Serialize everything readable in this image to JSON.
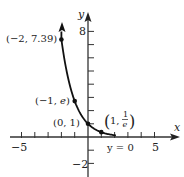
{
  "chart_data": {
    "type": "line",
    "title": "",
    "function": "y = e^(-x)",
    "xlabel": "x",
    "ylabel": "y",
    "xlim": [
      -5.8,
      6.8
    ],
    "ylim": [
      -2.4,
      8.8
    ],
    "grid": false,
    "x_ticks": [
      -5,
      -4,
      -3,
      -2,
      -1,
      1,
      2,
      3,
      4,
      5
    ],
    "y_ticks": [
      -2,
      -1,
      1,
      2,
      3,
      4,
      5,
      6,
      7,
      8
    ],
    "x_tick_labels": [
      {
        "value": -5,
        "text": "−5"
      },
      {
        "value": 5,
        "text": "5"
      }
    ],
    "y_tick_labels": [
      {
        "value": 8,
        "text": "8"
      },
      {
        "value": -2,
        "text": "−2"
      }
    ],
    "series": [
      {
        "name": "y = e^(-x)",
        "x": [
          -2,
          -1.5,
          -1,
          -0.5,
          0,
          0.5,
          1,
          1.5,
          2.1
        ],
        "y": [
          7.39,
          4.48,
          2.718,
          1.649,
          1,
          0.607,
          0.368,
          0.223,
          0.122
        ]
      }
    ],
    "points": [
      {
        "x": -2,
        "y": 7.39,
        "label": "(−2, 7.39)"
      },
      {
        "x": -1,
        "y": 2.718,
        "label": "(−1, e)"
      },
      {
        "x": 0,
        "y": 1,
        "label": "(0, 1)"
      },
      {
        "x": 1,
        "y": 0.368,
        "label": "(1, 1/e)"
      }
    ],
    "annotations": [
      {
        "text": "y = 0",
        "meaning": "horizontal asymptote"
      }
    ]
  },
  "labels": {
    "x_axis": "x",
    "y_axis": "y",
    "x_min_tick": "−5",
    "x_max_tick": "5",
    "y_max_tick": "8",
    "y_min_tick": "−2",
    "pt_a": "(−2, 7.39)",
    "pt_b_prefix": "(−1, ",
    "pt_b_e": "e",
    "pt_b_suffix": ")",
    "pt_c": "(0, 1)",
    "pt_d_prefix": "1, ",
    "pt_d_num": "1",
    "pt_d_den": "e",
    "asymptote": "y = 0"
  }
}
